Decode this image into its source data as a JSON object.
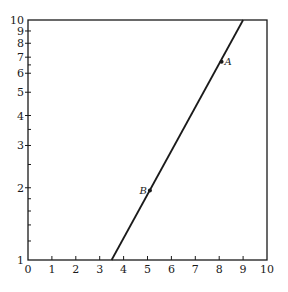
{
  "chart_data": {
    "type": "line",
    "title": "",
    "xlabel": "",
    "ylabel": "",
    "xscale": "linear",
    "yscale": "log",
    "xlim": [
      0,
      10
    ],
    "ylim": [
      1,
      10
    ],
    "x_ticks": [
      0,
      1,
      2,
      3,
      4,
      5,
      6,
      7,
      8,
      9,
      10
    ],
    "x_tick_labels": [
      "0",
      "1",
      "2",
      "3",
      "4",
      "5",
      "6",
      "7",
      "8",
      "9",
      "10"
    ],
    "y_ticks": [
      1,
      2,
      3,
      4,
      5,
      6,
      7,
      8,
      9,
      10
    ],
    "y_tick_labels": [
      "1",
      "2",
      "3",
      "4",
      "5",
      "6",
      "7",
      "8",
      "9",
      "10"
    ],
    "y_minor_ticks": [
      1.2,
      1.4,
      1.6,
      1.8,
      2.5,
      3.5,
      6.5
    ],
    "grid": false,
    "series": [
      {
        "name": "line",
        "x": [
          3.5,
          9.0
        ],
        "y": [
          1,
          10
        ],
        "color": "#1a1a1a"
      }
    ],
    "points": [
      {
        "label": "A",
        "x": 8.1,
        "y": 6.7,
        "label_side": "right"
      },
      {
        "label": "B",
        "x": 5.1,
        "y": 1.95,
        "label_side": "left"
      }
    ],
    "legend": null
  }
}
